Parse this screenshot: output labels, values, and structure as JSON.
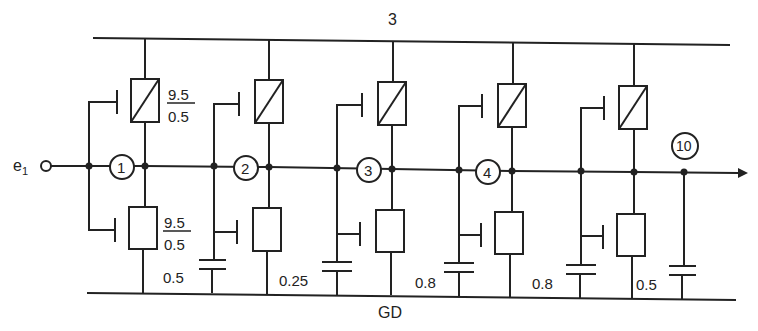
{
  "diagram": {
    "type": "circuit-schematic",
    "rails": {
      "top_label": "3",
      "bottom_label": "GD"
    },
    "input": {
      "label": "e",
      "subscript": "1"
    },
    "stages": [
      {
        "node_label": "1",
        "load_ratio_top": "9.5",
        "load_ratio_bottom": "0.5",
        "driver_ratio_top": "9.5",
        "driver_ratio_bottom": "0.5",
        "cap_label": "0.5"
      },
      {
        "node_label": "2",
        "cap_label": "0.25"
      },
      {
        "node_label": "3",
        "cap_label": "0.8"
      },
      {
        "node_label": "4",
        "cap_label": "0.8"
      },
      {
        "node_label": "",
        "cap_label": "0.5"
      }
    ],
    "output": {
      "node_label": "10"
    }
  }
}
